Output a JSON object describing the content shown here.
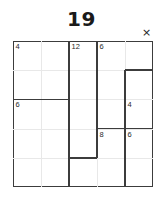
{
  "window": {
    "title": "19",
    "close_label": "×",
    "close_icon": "close-icon"
  },
  "theme": {
    "background": "#ffffff",
    "grid_line": "#e8e8e8",
    "region_line": "#3c3c3c",
    "text": "#2b2b2b",
    "title_color": "#1a1a1a"
  },
  "puzzle": {
    "type": "shikaku",
    "target_number": "19",
    "columns": 5,
    "rows": 5,
    "cell_size": 28,
    "clues": [
      {
        "label": "4",
        "row": 0,
        "col": 0
      },
      {
        "label": "12",
        "row": 0,
        "col": 2
      },
      {
        "label": "6",
        "row": 0,
        "col": 3
      },
      {
        "label": "6",
        "row": 2,
        "col": 0
      },
      {
        "label": "4",
        "row": 2,
        "col": 4
      },
      {
        "label": "8",
        "row": 3,
        "col": 3
      },
      {
        "label": "6",
        "row": 3,
        "col": 4
      }
    ],
    "region_edges": {
      "vertical": [
        {
          "col": 2,
          "row_start": 0,
          "row_end": 5
        },
        {
          "col": 3,
          "row_start": 0,
          "row_end": 4
        },
        {
          "col": 4,
          "row_start": 1,
          "row_end": 5
        }
      ],
      "horizontal": [
        {
          "row": 2,
          "col_start": 0,
          "col_end": 2
        },
        {
          "row": 1,
          "col_start": 4,
          "col_end": 5
        },
        {
          "row": 3,
          "col_start": 3,
          "col_end": 5
        },
        {
          "row": 4,
          "col_start": 2,
          "col_end": 3
        }
      ]
    }
  }
}
